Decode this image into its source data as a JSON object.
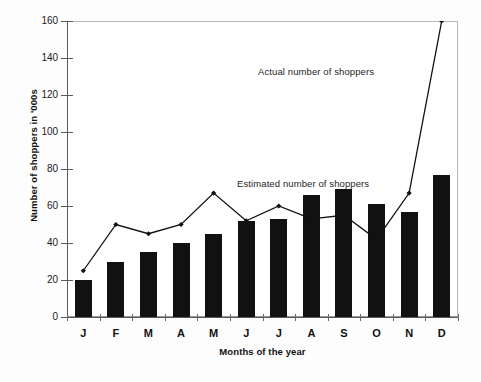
{
  "chart_data": {
    "type": "bar",
    "title": "",
    "xlabel": "Months of the year",
    "ylabel": "Number of shoppers in '000s",
    "categories": [
      "J",
      "F",
      "M",
      "A",
      "M",
      "J",
      "J",
      "A",
      "S",
      "O",
      "N",
      "D"
    ],
    "ylim": [
      0,
      160
    ],
    "ytick_step": 20,
    "yticks": [
      0,
      20,
      40,
      60,
      80,
      100,
      120,
      140,
      160
    ],
    "ytick_labels": [
      "0",
      "20",
      "40",
      "60",
      "80",
      "100",
      "120",
      "140",
      "160"
    ],
    "grid": false,
    "legend_position": "inline-annotations",
    "series": [
      {
        "name": "Estimated number of shoppers",
        "type": "bar",
        "color": "#111111",
        "values": [
          20,
          30,
          35,
          40,
          45,
          52,
          53,
          66,
          69,
          61,
          57,
          77
        ]
      },
      {
        "name": "Actual number of shoppers",
        "type": "line",
        "color": "#111111",
        "marker": "diamond",
        "values": [
          25,
          50,
          45,
          50,
          67,
          52,
          60,
          53,
          55,
          42,
          67,
          160
        ]
      }
    ],
    "annotations": [
      {
        "text": "Actual number of shoppers",
        "x_month": "A",
        "y_value": 131
      },
      {
        "text": "Estimated number of shoppers",
        "x_month": "J",
        "y_value": 75
      }
    ]
  },
  "axes": {
    "y_title": "Number of shoppers in '000s",
    "x_title": "Months of the year"
  },
  "annotations": {
    "actual": "Actual number of shoppers",
    "estimated": "Estimated number of shoppers"
  }
}
